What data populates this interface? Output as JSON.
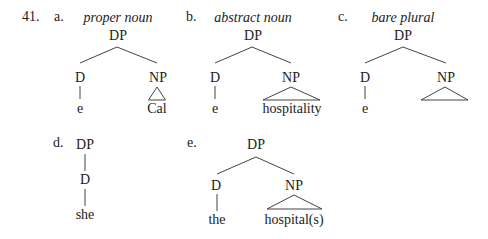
{
  "example_number": "41.",
  "trees": [
    {
      "label": "a.",
      "caption": "proper noun",
      "root": "DP",
      "children": [
        {
          "label": "D",
          "leaf": "e",
          "edge": "line"
        },
        {
          "label": "NP",
          "leaf": "Cal",
          "edge": "triangle"
        }
      ]
    },
    {
      "label": "b.",
      "caption": "abstract noun",
      "root": "DP",
      "children": [
        {
          "label": "D",
          "leaf": "e",
          "edge": "line"
        },
        {
          "label": "NP",
          "leaf": "hospitality",
          "edge": "triangle"
        }
      ]
    },
    {
      "label": "c.",
      "caption": "bare plural",
      "root": "DP",
      "children": [
        {
          "label": "D",
          "leaf": "e",
          "edge": "line"
        },
        {
          "label": "NP",
          "leaf": "hospitals",
          "edge": "triangle"
        }
      ]
    },
    {
      "label": "d.",
      "caption": "",
      "root": "DP",
      "children": [
        {
          "label": "D",
          "leaf": "she",
          "edge": "line"
        }
      ]
    },
    {
      "label": "e.",
      "caption": "",
      "root": "DP",
      "children": [
        {
          "label": "D",
          "leaf": "the",
          "edge": "line"
        },
        {
          "label": "NP",
          "leaf": "hospital(s)",
          "edge": "triangle"
        }
      ]
    }
  ]
}
